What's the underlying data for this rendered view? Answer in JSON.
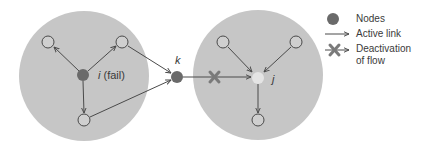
{
  "diagram": {
    "colors": {
      "region_fill": "#c6c6c6",
      "node_fill": "#6a6a6a",
      "failed_node_fill": "#6a6a6a",
      "target_node_fill": "#e4e4e4",
      "empty_node_stroke": "#4a4a4a",
      "link_stroke": "#4a4a4a",
      "cross_color": "#7a7a7a"
    },
    "regions": [
      {
        "id": "left-region",
        "cx": 84,
        "cy": 76,
        "r": 65
      },
      {
        "id": "right-region",
        "cx": 258,
        "cy": 75,
        "r": 65
      }
    ],
    "nodes": [
      {
        "id": "i",
        "label": "i",
        "label_suffix": " (fail)",
        "cx": 83,
        "cy": 75,
        "kind": "failed"
      },
      {
        "id": "k",
        "label": "k",
        "cx": 177,
        "cy": 77,
        "kind": "filled"
      },
      {
        "id": "j",
        "label": "j",
        "cx": 258,
        "cy": 78,
        "kind": "target"
      },
      {
        "id": "l1",
        "cx": 48,
        "cy": 42,
        "kind": "empty"
      },
      {
        "id": "l2",
        "cx": 122,
        "cy": 42,
        "kind": "empty"
      },
      {
        "id": "l3",
        "cx": 84,
        "cy": 120,
        "kind": "empty"
      },
      {
        "id": "r1",
        "cx": 223,
        "cy": 42,
        "kind": "empty"
      },
      {
        "id": "r2",
        "cx": 296,
        "cy": 42,
        "kind": "empty"
      },
      {
        "id": "r3",
        "cx": 258,
        "cy": 120,
        "kind": "empty"
      }
    ],
    "links": [
      {
        "from": "i",
        "to": "l1",
        "state": "active"
      },
      {
        "from": "i",
        "to": "l2",
        "state": "active"
      },
      {
        "from": "i",
        "to": "l3",
        "state": "active"
      },
      {
        "from": "l2",
        "to": "k",
        "state": "active"
      },
      {
        "from": "l3",
        "to": "k",
        "state": "active"
      },
      {
        "from": "k",
        "to": "j",
        "state": "deactivated"
      },
      {
        "from": "r1",
        "to": "j",
        "state": "active"
      },
      {
        "from": "r2",
        "to": "j",
        "state": "active"
      },
      {
        "from": "j",
        "to": "r3",
        "state": "active"
      }
    ],
    "labels": {
      "i_text": "i",
      "i_suffix": " (fail)",
      "k_text": "k",
      "j_text": "j"
    }
  },
  "legend": {
    "items": [
      {
        "symbol": "filled-node",
        "label": "Nodes"
      },
      {
        "symbol": "arrow",
        "label": "Active link"
      },
      {
        "symbol": "crossed-arrow",
        "label_line1": "Deactivation",
        "label_line2": "of flow"
      }
    ]
  }
}
